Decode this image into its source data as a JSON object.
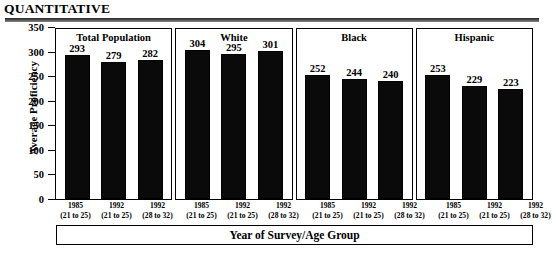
{
  "header": {
    "title": "QUANTITATIVE"
  },
  "chart_data": {
    "type": "bar",
    "title": "QUANTITATIVE",
    "xlabel": "Year of Survey/Age Group",
    "ylabel": "Average Proficiency",
    "ylim": [
      0,
      350
    ],
    "yticks": [
      0,
      50,
      100,
      150,
      200,
      250,
      300,
      350
    ],
    "ytick_labels": [
      "0",
      "50",
      "100",
      "150",
      "200",
      "250",
      "300",
      "350"
    ],
    "grid": false,
    "legend": "none",
    "categories": [
      "1985\n(21 to 25)",
      "1992\n(21 to 25)",
      "1992\n(28 to 32)"
    ],
    "panels": [
      {
        "name": "Total Population",
        "bars": [
          {
            "year": "1985",
            "age": "(21 to 25)",
            "value": 293
          },
          {
            "year": "1992",
            "age": "(21 to 25)",
            "value": 279
          },
          {
            "year": "1992",
            "age": "(28 to 32)",
            "value": 282
          }
        ]
      },
      {
        "name": "White",
        "bars": [
          {
            "year": "1985",
            "age": "(21 to 25)",
            "value": 304
          },
          {
            "year": "1992",
            "age": "(21 to 25)",
            "value": 295
          },
          {
            "year": "1992",
            "age": "(28 to 32)",
            "value": 301
          }
        ]
      },
      {
        "name": "Black",
        "bars": [
          {
            "year": "1985",
            "age": "(21 to 25)",
            "value": 252
          },
          {
            "year": "1992",
            "age": "(21 to 25)",
            "value": 244
          },
          {
            "year": "1992",
            "age": "(28 to 32)",
            "value": 240
          }
        ]
      },
      {
        "name": "Hispanic",
        "bars": [
          {
            "year": "1985",
            "age": "(21 to 25)",
            "value": 253
          },
          {
            "year": "1992",
            "age": "(21 to 25)",
            "value": 229
          },
          {
            "year": "1992",
            "age": "(28 to 32)",
            "value": 223
          }
        ]
      }
    ],
    "colors": {
      "bar_fill": "#0a0a0a",
      "axis": "#000000",
      "background": "#ffffff",
      "rule": "#3a3a3a"
    }
  }
}
